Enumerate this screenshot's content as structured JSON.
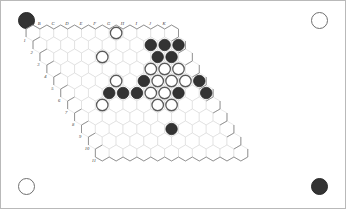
{
  "app": {
    "title": "Hex Board Position",
    "board_type": "hex",
    "size": 11
  },
  "colors": {
    "black_stone": "#333333",
    "white_stone": "#ffffff",
    "white_stone_outline": "#5a5a5a",
    "grid_line": "#d3d3d3",
    "board_outline": "#8a8a8a",
    "page_background": "#ffffff",
    "label_text": "#3a3a3a"
  },
  "axes": {
    "column_labels": [
      "A",
      "B",
      "C",
      "D",
      "E",
      "F",
      "G",
      "H",
      "I",
      "J",
      "K"
    ],
    "row_labels": [
      "1",
      "2",
      "3",
      "4",
      "5",
      "6",
      "7",
      "8",
      "9",
      "10",
      "11"
    ]
  },
  "corner_markers": [
    {
      "name": "top-left",
      "color": "black"
    },
    {
      "name": "top-right",
      "color": "white"
    },
    {
      "name": "bottom-left",
      "color": "white"
    },
    {
      "name": "bottom-right",
      "color": "black"
    }
  ],
  "stones": [
    {
      "col": "G",
      "row": "1",
      "color": "white"
    },
    {
      "col": "E",
      "row": "3",
      "color": "white"
    },
    {
      "col": "I",
      "row": "2",
      "color": "black"
    },
    {
      "col": "J",
      "row": "2",
      "color": "black"
    },
    {
      "col": "K",
      "row": "2",
      "color": "black"
    },
    {
      "col": "I",
      "row": "3",
      "color": "black"
    },
    {
      "col": "J",
      "row": "3",
      "color": "black"
    },
    {
      "col": "H",
      "row": "4",
      "color": "white"
    },
    {
      "col": "I",
      "row": "4",
      "color": "white"
    },
    {
      "col": "J",
      "row": "4",
      "color": "white"
    },
    {
      "col": "E",
      "row": "5",
      "color": "white"
    },
    {
      "col": "G",
      "row": "5",
      "color": "black"
    },
    {
      "col": "H",
      "row": "5",
      "color": "white"
    },
    {
      "col": "I",
      "row": "5",
      "color": "white"
    },
    {
      "col": "J",
      "row": "5",
      "color": "white"
    },
    {
      "col": "K",
      "row": "5",
      "color": "black"
    },
    {
      "col": "G",
      "row": "6",
      "color": "white"
    },
    {
      "col": "H",
      "row": "6",
      "color": "white"
    },
    {
      "col": "I",
      "row": "6",
      "color": "black"
    },
    {
      "col": "D",
      "row": "6",
      "color": "black"
    },
    {
      "col": "E",
      "row": "6",
      "color": "black"
    },
    {
      "col": "F",
      "row": "6",
      "color": "black"
    },
    {
      "col": "G",
      "row": "7",
      "color": "white"
    },
    {
      "col": "H",
      "row": "7",
      "color": "white"
    },
    {
      "col": "C",
      "row": "7",
      "color": "white"
    },
    {
      "col": "G",
      "row": "9",
      "color": "black"
    },
    {
      "col": "K",
      "row": "6",
      "color": "black"
    }
  ],
  "stone_counts": {
    "black": 13,
    "white": 14
  }
}
